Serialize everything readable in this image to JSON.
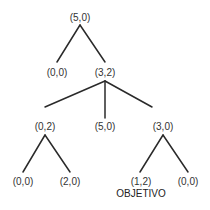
{
  "diagram": {
    "type": "tree",
    "nodes": [
      {
        "id": "n0",
        "label": "(5,0)",
        "x": 80,
        "y": 18
      },
      {
        "id": "n1",
        "label": "(0,0)",
        "x": 57,
        "y": 73
      },
      {
        "id": "n2",
        "label": "(3,2)",
        "x": 105,
        "y": 73
      },
      {
        "id": "n3",
        "label": "(0,2)",
        "x": 45,
        "y": 127
      },
      {
        "id": "n4",
        "label": "(5,0)",
        "x": 105,
        "y": 127
      },
      {
        "id": "n5",
        "label": "(3,0)",
        "x": 163,
        "y": 127
      },
      {
        "id": "n6",
        "label": "(0,0)",
        "x": 23,
        "y": 182
      },
      {
        "id": "n7",
        "label": "(2,0)",
        "x": 70,
        "y": 182
      },
      {
        "id": "n8",
        "label": "(1,2)",
        "x": 141,
        "y": 182
      },
      {
        "id": "n9",
        "label": "(0,0)",
        "x": 188,
        "y": 182
      }
    ],
    "edges": [
      {
        "from": "n0",
        "to": "n1"
      },
      {
        "from": "n0",
        "to": "n2"
      },
      {
        "from": "n2",
        "to": "n3"
      },
      {
        "from": "n2",
        "to": "n4"
      },
      {
        "from": "n2",
        "to": "n5"
      },
      {
        "from": "n3",
        "to": "n6"
      },
      {
        "from": "n3",
        "to": "n7"
      },
      {
        "from": "n5",
        "to": "n8"
      },
      {
        "from": "n5",
        "to": "n9"
      }
    ],
    "goal_label": "OBJETIVO",
    "goal_node": "n8",
    "line_color": "#2a2a2a",
    "text_color": "#333333"
  }
}
